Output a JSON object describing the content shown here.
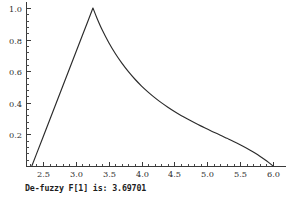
{
  "chart_data": {
    "type": "line",
    "title": "",
    "subtitle": "",
    "xlabel": "",
    "ylabel": "",
    "xlim": [
      2.28,
      6.05
    ],
    "ylim": [
      0.0,
      1.03
    ],
    "grid": false,
    "legend": null,
    "legend_position": "none",
    "x_ticks": [
      2.5,
      3.0,
      3.5,
      4.0,
      4.5,
      5.0,
      5.5,
      6.0
    ],
    "x_tick_labels": [
      "2.5",
      "3.0",
      "3.5",
      "4.0",
      "4.5",
      "5.0",
      "5.5",
      "6.0"
    ],
    "x_minor_step": 0.1,
    "y_ticks": [
      0.2,
      0.4,
      0.6,
      0.8,
      1.0
    ],
    "y_tick_labels": [
      "0.2",
      "0.4",
      "0.6",
      "0.8",
      "1.0"
    ],
    "y_minor_step": 0.04,
    "series": [
      {
        "name": "membership",
        "color": "#2b2b2b",
        "points": [
          [
            2.33,
            0.0
          ],
          [
            2.4,
            0.075
          ],
          [
            2.5,
            0.182
          ],
          [
            2.6,
            0.29
          ],
          [
            2.7,
            0.397
          ],
          [
            2.8,
            0.505
          ],
          [
            2.9,
            0.612
          ],
          [
            3.0,
            0.72
          ],
          [
            3.1,
            0.827
          ],
          [
            3.18,
            0.913
          ],
          [
            3.26,
            1.0
          ],
          [
            3.32,
            0.937
          ],
          [
            3.4,
            0.862
          ],
          [
            3.5,
            0.782
          ],
          [
            3.6,
            0.712
          ],
          [
            3.7,
            0.651
          ],
          [
            3.8,
            0.597
          ],
          [
            3.9,
            0.549
          ],
          [
            4.0,
            0.506
          ],
          [
            4.1,
            0.468
          ],
          [
            4.2,
            0.433
          ],
          [
            4.3,
            0.401
          ],
          [
            4.4,
            0.372
          ],
          [
            4.5,
            0.345
          ],
          [
            4.6,
            0.32
          ],
          [
            4.7,
            0.297
          ],
          [
            4.8,
            0.275
          ],
          [
            4.9,
            0.254
          ],
          [
            5.0,
            0.234
          ],
          [
            5.1,
            0.214
          ],
          [
            5.2,
            0.195
          ],
          [
            5.3,
            0.175
          ],
          [
            5.4,
            0.155
          ],
          [
            5.5,
            0.134
          ],
          [
            5.6,
            0.112
          ],
          [
            5.7,
            0.088
          ],
          [
            5.8,
            0.062
          ],
          [
            5.9,
            0.033
          ],
          [
            6.0,
            0.0
          ]
        ]
      }
    ],
    "annotations": {
      "peak_x": 3.26,
      "peak_y": 1.0,
      "left_zero_x": 2.33,
      "right_zero_x": 6.0,
      "defuzzified_value": 3.69701
    }
  },
  "caption": {
    "text": "De-fuzzy F[1] is: 3.69701",
    "label": "De-fuzzy F[1] is:",
    "value": "3.69701"
  },
  "colors": {
    "curve": "#2b2b2b",
    "axis": "#3a3a3a",
    "background": "#ffffff",
    "text": "#262626"
  }
}
